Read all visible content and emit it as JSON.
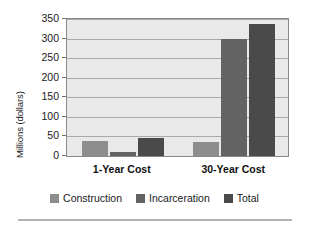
{
  "chart_data": {
    "type": "bar",
    "title": "",
    "xlabel": "",
    "ylabel": "Millions (dollars)",
    "categories": [
      "1-Year Cost",
      "30-Year Cost"
    ],
    "series": [
      {
        "name": "Construction",
        "values": [
          38,
          37
        ],
        "color": "#8d8d8d"
      },
      {
        "name": "Incarceration",
        "values": [
          10,
          300
        ],
        "color": "#636363"
      },
      {
        "name": "Total",
        "values": [
          47,
          337
        ],
        "color": "#4a4a4a"
      }
    ],
    "ylim": [
      0,
      350
    ],
    "yticks": [
      0,
      50,
      100,
      150,
      200,
      250,
      300,
      350
    ],
    "ytick_labels": [
      "0",
      "50",
      "100",
      "150",
      "200",
      "250",
      "300",
      "350"
    ],
    "grid": true,
    "legend_position": "bottom"
  }
}
